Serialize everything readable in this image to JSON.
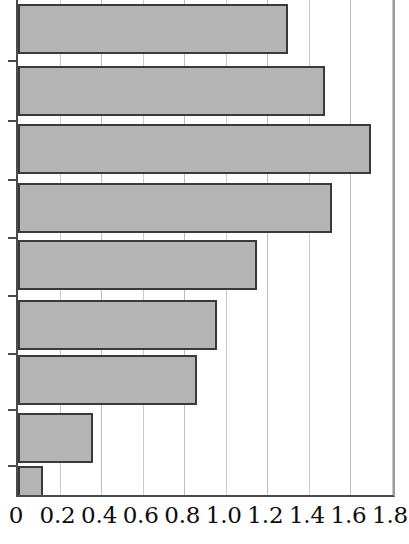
{
  "chart_data": {
    "type": "bar",
    "orientation": "horizontal",
    "title": "",
    "xlabel": "",
    "ylabel": "",
    "xlim": [
      0,
      1.8
    ],
    "xticks": [
      0,
      0.2,
      0.4,
      0.6,
      0.8,
      1.0,
      1.2,
      1.4,
      1.6,
      1.8
    ],
    "xtick_labels": [
      "0",
      "0.2",
      "0.4",
      "0.6",
      "0.8",
      "1.0",
      "1.2",
      "1.4",
      "1.6",
      "1.8"
    ],
    "grid": true,
    "grid_axis": "x",
    "legend": null,
    "categories": [
      "",
      "",
      "",
      "",
      "",
      "",
      "",
      "",
      ""
    ],
    "values": [
      1.29,
      1.47,
      1.69,
      1.5,
      1.14,
      0.95,
      0.85,
      0.35,
      0.11
    ],
    "bar_color": "#b4b4b4",
    "bar_edge_color": "#3a3a3a",
    "axis_color": "#4a4a4a",
    "grid_color": "#c9c9c9",
    "note": "Horizontal bar chart, y-axis category labels are cropped out of the screenshot; first bar is clipped at the top edge."
  },
  "axis": {
    "tick_count": 10,
    "first_label": "0",
    "last_label": "1.8"
  }
}
